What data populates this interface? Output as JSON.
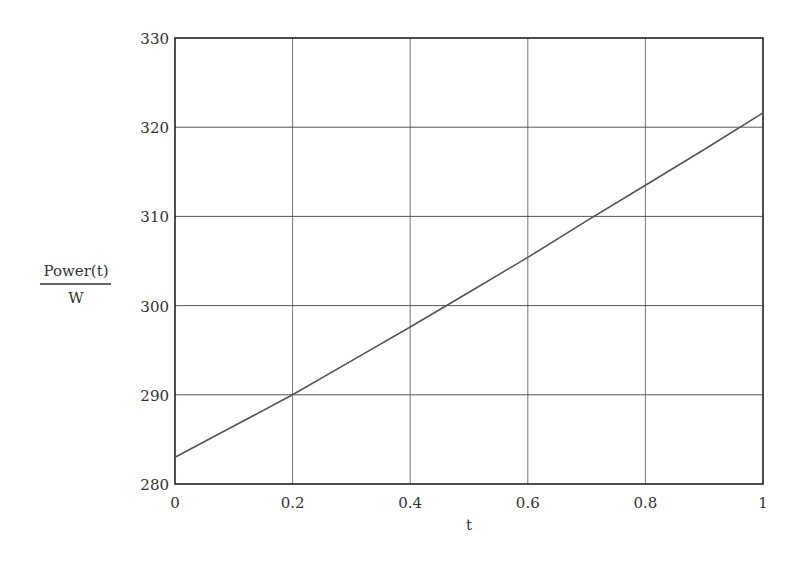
{
  "chart_data": {
    "type": "line",
    "title": "",
    "xlabel": "t",
    "ylabel_numerator": "Power(t)",
    "ylabel_denominator": "W",
    "xlim": [
      0,
      1
    ],
    "ylim": [
      280,
      330
    ],
    "grid": true,
    "x_ticks": [
      "0",
      "0.2",
      "0.4",
      "0.6",
      "0.8",
      "1"
    ],
    "y_ticks": [
      "280",
      "290",
      "300",
      "310",
      "320",
      "330"
    ],
    "series": [
      {
        "name": "Power(t)/W",
        "x": [
          0,
          0.1,
          0.2,
          0.3,
          0.4,
          0.5,
          0.6,
          0.7,
          0.8,
          0.9,
          1.0
        ],
        "values": [
          283.0,
          286.5,
          290.0,
          293.8,
          297.6,
          301.5,
          305.4,
          309.5,
          313.5,
          317.5,
          321.6
        ]
      }
    ],
    "line_color": "#555555"
  }
}
